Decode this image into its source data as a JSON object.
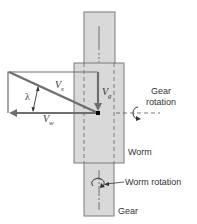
{
  "diagram": {
    "type": "worm-gear velocity diagram",
    "colors": {
      "body_fill": "#d9d9d9",
      "body_stroke": "#7a7a7a",
      "vector": "#6e6e6e",
      "text": "#333333",
      "center_dot": "#000000"
    },
    "labels": {
      "vs": {
        "main": "V",
        "sub": "s"
      },
      "vg": {
        "main": "V",
        "sub": "g"
      },
      "vw": {
        "main": "V",
        "sub": "w"
      },
      "lambda": "λ",
      "gear_rotation_line1": "Gear",
      "gear_rotation_line2": "rotation",
      "worm": "Worm",
      "worm_rotation": "Worm rotation",
      "gear": "Gear"
    }
  }
}
